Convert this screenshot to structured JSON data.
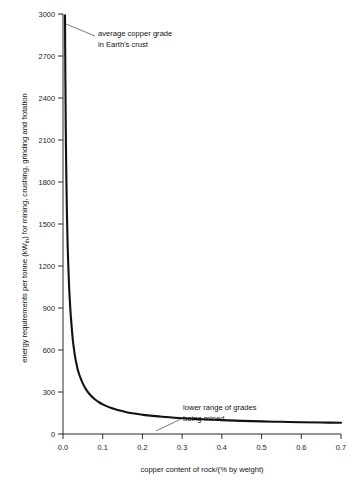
{
  "chart_data": {
    "type": "line",
    "title": "",
    "xlabel": "copper content of rock/(% by weight)",
    "ylabel_parts": {
      "before": "energy requirements per tonne (kW",
      "subscript": "th",
      "after": ") for mining, crushing, grinding and flotation"
    },
    "ylabel": "energy requirements per tonne (kWth) for mining, crushing, grinding and flotation",
    "xlim": [
      0.0,
      0.7
    ],
    "ylim": [
      0,
      3000
    ],
    "grid": false,
    "legend": "none",
    "x_ticks": [
      0.0,
      0.1,
      0.2,
      0.3,
      0.4,
      0.5,
      0.6,
      0.7
    ],
    "x_tick_labels": [
      "0.0",
      "0.1",
      "0.2",
      "0.3",
      "0.4",
      "0.5",
      "0.6",
      "0.7"
    ],
    "y_ticks": [
      0,
      300,
      600,
      900,
      1200,
      1500,
      1800,
      2100,
      2400,
      2700,
      3000
    ],
    "y_tick_labels": [
      "0",
      "300",
      "600",
      "900",
      "1200",
      "1500",
      "1800",
      "2100",
      "2400",
      "2700",
      "3000"
    ],
    "series": [
      {
        "name": "energy requirement vs copper grade",
        "x": [
          0.005,
          0.006,
          0.007,
          0.008,
          0.01,
          0.012,
          0.015,
          0.018,
          0.02,
          0.025,
          0.03,
          0.035,
          0.04,
          0.05,
          0.06,
          0.07,
          0.08,
          0.09,
          0.1,
          0.12,
          0.14,
          0.16,
          0.18,
          0.2,
          0.22,
          0.25,
          0.28,
          0.3,
          0.35,
          0.4,
          0.45,
          0.5,
          0.55,
          0.6,
          0.65,
          0.7
        ],
        "y": [
          2990,
          2520,
          2180,
          1920,
          1560,
          1320,
          1075,
          915,
          830,
          665,
          560,
          487,
          432,
          360,
          310,
          275,
          248,
          228,
          212,
          187,
          169,
          156,
          146,
          138,
          131,
          123,
          116,
          113,
          105,
          99,
          94,
          90,
          87,
          84,
          82,
          80
        ]
      }
    ],
    "annotations": [
      {
        "name": "average-copper-grade-annotation",
        "lines": [
          "average copper grade",
          "in Earth's crust"
        ],
        "text_x": 98,
        "text_y": 36,
        "leader": {
          "x1": 66,
          "y1": 24,
          "x2": 95,
          "y2": 36
        }
      },
      {
        "name": "lower-range-of-grades-annotation",
        "lines": [
          "lower range of grades",
          "being mined"
        ],
        "text_x": 183,
        "text_y": 410,
        "leader": {
          "x1": 156,
          "y1": 431,
          "x2": 181,
          "y2": 419
        }
      }
    ],
    "colors": {
      "curve": "#111111",
      "axis": "#2b2b2b",
      "text": "#141414",
      "leader": "#5a5a5a",
      "background": "#ffffff"
    }
  }
}
